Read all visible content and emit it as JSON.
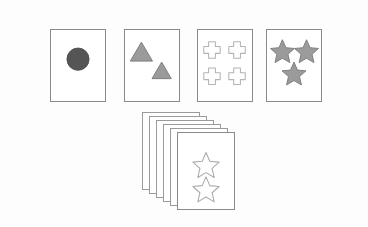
{
  "diagram": {
    "background_color": "#fdfdfd",
    "card_fill": "#ffffff",
    "card_stroke": "#8a8a8a",
    "filled_shape_fill": "#9b9b9b",
    "filled_shape_stroke": "#7d7d7d",
    "dark_shape_fill": "#555555",
    "outline_shape_stroke": "#b4b4b4"
  },
  "cards": [
    {
      "id": "card-circle",
      "label": "card-with-one-circle",
      "shape": "circle",
      "shape_label": "circle",
      "count": 1,
      "style": "filled-dark",
      "x": 50,
      "y": 29,
      "width": 56,
      "height": 73
    },
    {
      "id": "card-triangles",
      "label": "card-with-two-triangles",
      "shape": "triangle",
      "shape_label": "triangle",
      "count": 2,
      "style": "filled-gray",
      "x": 124,
      "y": 29,
      "width": 56,
      "height": 73
    },
    {
      "id": "card-crosses",
      "label": "card-with-four-crosses",
      "shape": "cross",
      "shape_label": "cross",
      "count": 4,
      "style": "outline",
      "x": 197,
      "y": 29,
      "width": 56,
      "height": 73
    },
    {
      "id": "card-stars",
      "label": "card-with-three-stars",
      "shape": "star",
      "shape_label": "star",
      "count": 3,
      "style": "filled-gray",
      "x": 266,
      "y": 29,
      "width": 56,
      "height": 73
    }
  ],
  "deck": {
    "id": "card-deck",
    "label": "stack-of-cards",
    "total_cards": 6,
    "offset_x": 7,
    "offset_y": 4,
    "front_card": {
      "shape": "star",
      "shape_label": "star",
      "count": 2,
      "style": "outline"
    }
  }
}
